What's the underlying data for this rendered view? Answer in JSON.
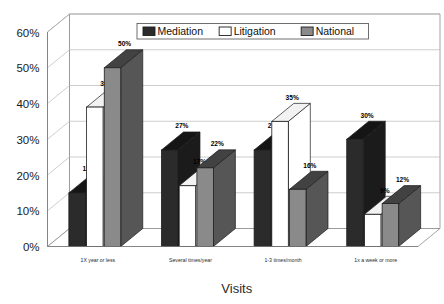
{
  "chart_data": {
    "type": "bar",
    "title": "",
    "xlabel": "Visits",
    "ylabel": "",
    "categories": [
      "1X year or less",
      "Several times/year",
      "1-3 times/month",
      "1x a week or more"
    ],
    "series": [
      {
        "name": "Mediation",
        "color": "#2b2b2b",
        "values": [
          15,
          27,
          27,
          30
        ]
      },
      {
        "name": "Litigation",
        "color": "#ffffff",
        "values": [
          39,
          17,
          35,
          9
        ]
      },
      {
        "name": "National",
        "color": "#8a8a8a",
        "values": [
          50,
          22,
          16,
          12
        ]
      }
    ],
    "value_labels": [
      [
        "15%",
        "39%",
        "50%"
      ],
      [
        "27%",
        "17%",
        "22%"
      ],
      [
        "27%",
        "35%",
        "16%"
      ],
      [
        "30%",
        "9%",
        "12%"
      ]
    ],
    "ylim": [
      0,
      60
    ],
    "ytick_labels": [
      "0%",
      "10%",
      "20%",
      "30%",
      "40%",
      "50%",
      "60%"
    ],
    "ytick_values": [
      0,
      10,
      20,
      30,
      40,
      50,
      60
    ],
    "grid": true,
    "legend_position": "top-center",
    "three_d": true
  },
  "legend": {
    "items": [
      {
        "label": "Mediation",
        "swatch": "#2b2b2b"
      },
      {
        "label": "Litigation",
        "swatch": "#ffffff"
      },
      {
        "label": "National",
        "swatch": "#8a8a8a"
      }
    ]
  }
}
